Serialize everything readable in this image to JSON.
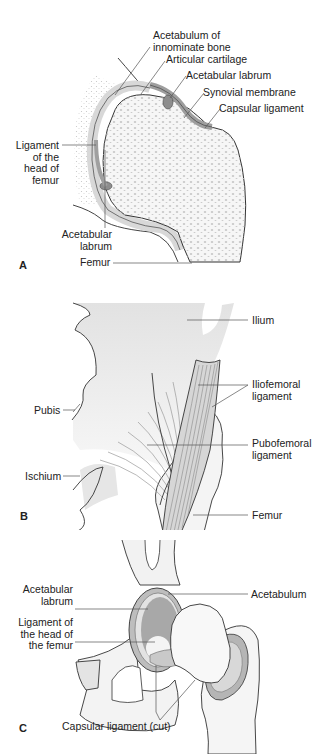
{
  "figure": {
    "panels": [
      {
        "id": "A",
        "title": "Coronal section of hip joint",
        "labels": {
          "acetabulum_innominate": "Acetabulum of\ninnominate bone",
          "articular_cartilage": "Articular cartilage",
          "acetabular_labrum_top": "Acetabular labrum",
          "synovial_membrane": "Synovial membrane",
          "capsular_ligament": "Capsular ligament",
          "ligament_head_femur": "Ligament\nof the\nhead of\nfemur",
          "acetabular_labrum_bottom": "Acetabular\nlabrum",
          "femur": "Femur"
        },
        "letter": "A"
      },
      {
        "id": "B",
        "title": "Anterior view of hip ligaments",
        "labels": {
          "ilium": "Ilium",
          "iliofemoral": "Iliofemoral\nligament",
          "pubis": "Pubis",
          "pubofemoral": "Pubofemoral\nligament",
          "ischium": "Ischium",
          "femur": "Femur"
        },
        "letter": "B"
      },
      {
        "id": "C",
        "title": "Opened hip joint",
        "labels": {
          "acetabular_labrum": "Acetabular\nlabrum",
          "acetabulum": "Acetabulum",
          "ligament_head_femur": "Ligament of\nthe head of\nthe femur",
          "capsular_ligament_cut": "Capsular ligament (cut)"
        },
        "letter": "C"
      }
    ]
  },
  "colors": {
    "bone_fill": "#f3f3f3",
    "bone_stipple": "#bdbdbd",
    "cartilage": "#d9d9d9",
    "ligament": "#a9a9a9",
    "outline": "#333333",
    "leader": "#555555"
  }
}
